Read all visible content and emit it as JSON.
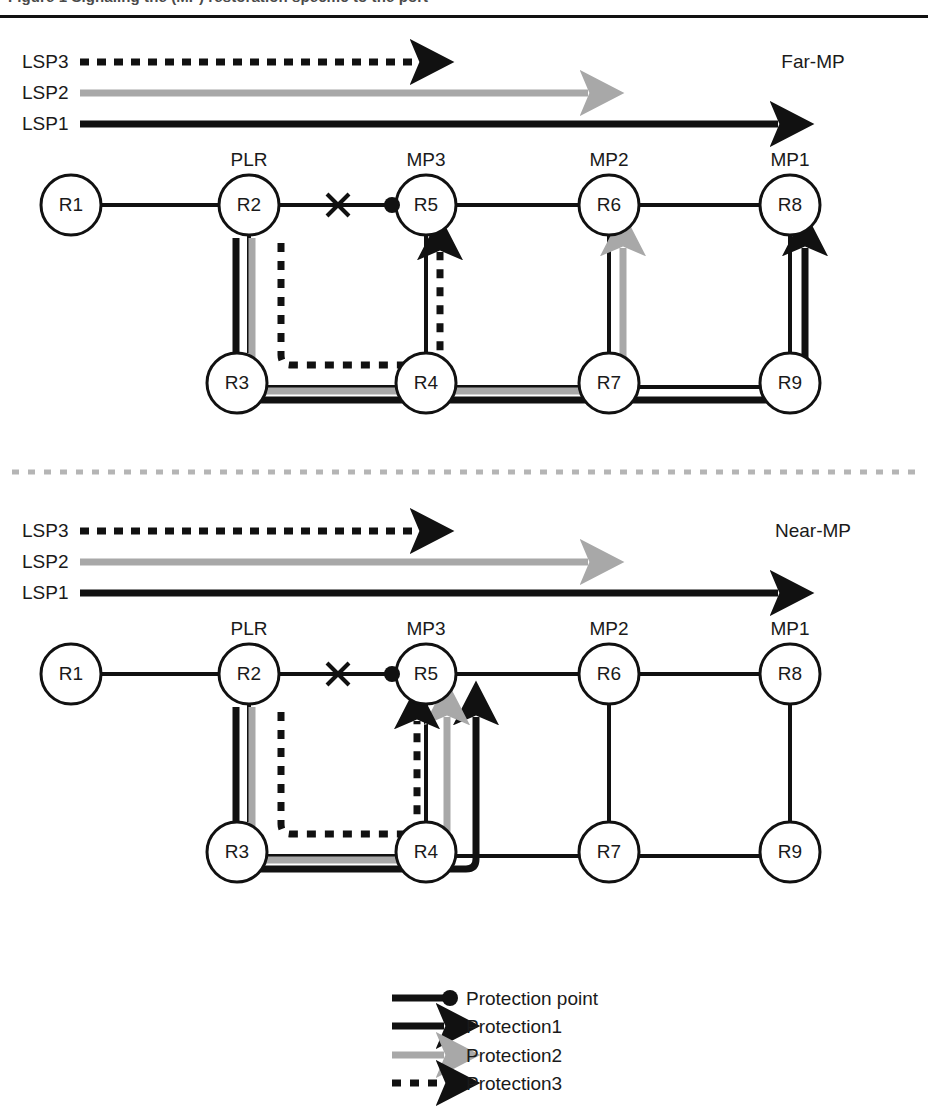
{
  "figure": {
    "caption": "Figure 1  Signaling the (MP) restoration specific to the port",
    "title_visible_fragment": ""
  },
  "sections": [
    {
      "id": "far-mp",
      "label": "Far-MP",
      "lsp_legend": [
        {
          "name": "LSP3",
          "style": "dashed-black",
          "end_x": 430
        },
        {
          "name": "LSP2",
          "style": "solid-gray",
          "end_x": 600
        },
        {
          "name": "LSP1",
          "style": "solid-black",
          "end_x": 790
        }
      ],
      "nodes": [
        {
          "id": "R1",
          "role": "",
          "x": 71,
          "y": 205
        },
        {
          "id": "R2",
          "role": "PLR",
          "x": 249,
          "y": 205
        },
        {
          "id": "R5",
          "role": "MP3",
          "x": 426,
          "y": 205
        },
        {
          "id": "R6",
          "role": "MP2",
          "x": 609,
          "y": 205
        },
        {
          "id": "R8",
          "role": "MP1",
          "x": 790,
          "y": 205
        },
        {
          "id": "R3",
          "role": "",
          "x": 237,
          "y": 383
        },
        {
          "id": "R4",
          "role": "",
          "x": 426,
          "y": 383
        },
        {
          "id": "R7",
          "role": "",
          "x": 609,
          "y": 383
        },
        {
          "id": "R9",
          "role": "",
          "x": 790,
          "y": 383
        }
      ],
      "failure_mark": {
        "x": 338,
        "y": 205,
        "symbol": "x-cross"
      },
      "protection_point": {
        "x": 392,
        "y": 205,
        "symbol": "filled-dot"
      },
      "protection_paths": [
        {
          "name": "Protection1",
          "style": "solid-black",
          "via": [
            "R2",
            "R3",
            "R4",
            "R7",
            "R9",
            "R8"
          ]
        },
        {
          "name": "Protection2",
          "style": "solid-gray",
          "via": [
            "R2",
            "R3",
            "R4",
            "R7",
            "R6"
          ]
        },
        {
          "name": "Protection3",
          "style": "dashed-black",
          "via": [
            "R2",
            "R3",
            "R4",
            "R5"
          ]
        }
      ]
    },
    {
      "id": "near-mp",
      "label": "Near-MP",
      "lsp_legend": [
        {
          "name": "LSP3",
          "style": "dashed-black",
          "end_x": 430
        },
        {
          "name": "LSP2",
          "style": "solid-gray",
          "end_x": 600
        },
        {
          "name": "LSP1",
          "style": "solid-black",
          "end_x": 790
        }
      ],
      "nodes": [
        {
          "id": "R1",
          "role": "",
          "x": 71,
          "y": 674
        },
        {
          "id": "R2",
          "role": "PLR",
          "x": 249,
          "y": 674
        },
        {
          "id": "R5",
          "role": "MP3",
          "x": 426,
          "y": 674
        },
        {
          "id": "R6",
          "role": "MP2",
          "x": 609,
          "y": 674
        },
        {
          "id": "R8",
          "role": "MP1",
          "x": 790,
          "y": 674
        },
        {
          "id": "R3",
          "role": "",
          "x": 237,
          "y": 852
        },
        {
          "id": "R4",
          "role": "",
          "x": 426,
          "y": 852
        },
        {
          "id": "R7",
          "role": "",
          "x": 609,
          "y": 852
        },
        {
          "id": "R9",
          "role": "",
          "x": 790,
          "y": 852
        }
      ],
      "failure_mark": {
        "x": 338,
        "y": 674,
        "symbol": "x-cross"
      },
      "protection_point": {
        "x": 392,
        "y": 674,
        "symbol": "filled-dot"
      },
      "protection_paths": [
        {
          "name": "Protection1",
          "style": "solid-black",
          "via": [
            "R2",
            "R3",
            "R4",
            "R5"
          ]
        },
        {
          "name": "Protection2",
          "style": "solid-gray",
          "via": [
            "R2",
            "R3",
            "R4",
            "R5"
          ]
        },
        {
          "name": "Protection3",
          "style": "dashed-black",
          "via": [
            "R2",
            "R3",
            "R4",
            "R5"
          ]
        }
      ]
    }
  ],
  "separator": {
    "style": "dashed-gray",
    "y": 472
  },
  "legend": {
    "items": [
      {
        "label": "Protection point",
        "style": "line-dot"
      },
      {
        "label": "Protection1",
        "style": "solid-black-arrow"
      },
      {
        "label": "Protection2",
        "style": "solid-gray-arrow"
      },
      {
        "label": "Protection3",
        "style": "dashed-black-arrow"
      }
    ]
  },
  "colors": {
    "ink": "#111111",
    "gray_path": "#a8a8a8",
    "separator_gray": "#b5b5b5",
    "caption_gray": "#4a4a4a",
    "background": "#ffffff"
  }
}
